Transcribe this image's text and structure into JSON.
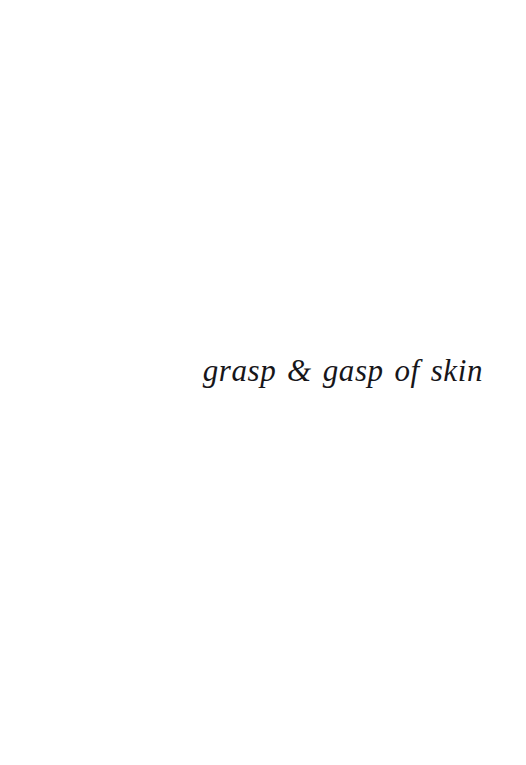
{
  "page": {
    "kind": "book-page",
    "background_color": "#ffffff",
    "ink_color": "#17161a",
    "width_px": 526,
    "height_px": 765
  },
  "content": {
    "title_line": "grasp & gasp of skin",
    "alignment": "right-of-center",
    "style": "italic-serif"
  }
}
